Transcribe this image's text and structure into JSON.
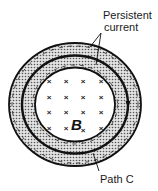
{
  "diagram": {
    "labels": {
      "persistent_line1": "Persistent",
      "persistent_line2": "current",
      "field": "B",
      "path": "Path C"
    },
    "colors": {
      "stroke": "#111111",
      "stipple_bg": "#d8d8d8",
      "stipple_dot": "#555555",
      "background": "#ffffff"
    },
    "field_markers": {
      "symbol": "×",
      "rows": 4,
      "cols": 4
    }
  }
}
